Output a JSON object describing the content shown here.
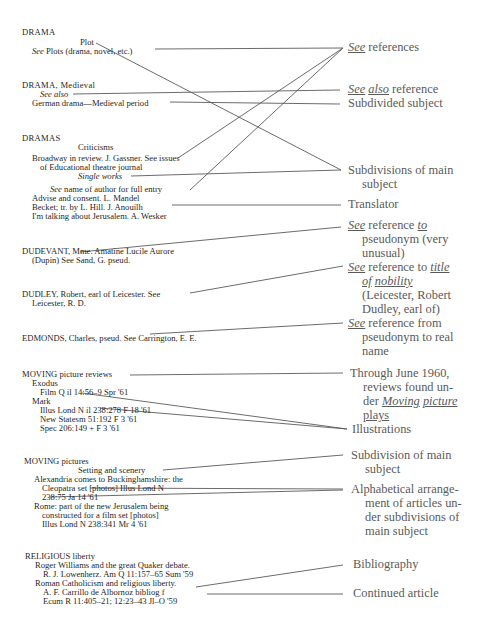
{
  "entries": {
    "drama": {
      "heading": "DRAMA",
      "subhead": "Plot",
      "see_word": "See",
      "see_text": " Plots (drama, novel, etc.)"
    },
    "drama_medieval": {
      "heading": "DRAMA, Medieval",
      "see_also": "See also",
      "ref": "German drama—Medieval period"
    },
    "dramas": {
      "heading": "DRAMAS",
      "subhead": "Criticisms",
      "line1": "Broadway in review. J. Gassner. See issues",
      "line2": "of Educational theatre journal",
      "subhead2": "Single works",
      "see_word": "See",
      "see_text": " name of author for full entry",
      "item1": "Advise and consent. L. Mandel",
      "item2": "Becket; tr. by L. Hill. J. Anouilh",
      "item3": "I'm talking about Jerusalem. A. Wesker"
    },
    "dudevant": {
      "line1": "DUDEVANT, Mme. Amatine Lucile Aurore",
      "line2": "(Dupin) See Sand, G. pseud."
    },
    "dudley": {
      "line1": "DUDLEY, Robert, earl of Leicester. See",
      "line2": "Leicester, R. D."
    },
    "edmonds": {
      "line1": "EDMONDS, Charles, pseud. See Carrington, E. E."
    },
    "moving_reviews": {
      "heading": "MOVING picture reviews",
      "title1": "Exodus",
      "cite1": "Film Q il 14:56–9 Spr '61",
      "title2": "Mark",
      "cite2": "Illus Lond N il 238:278 F 18 '61",
      "cite3": "New Statesm 51:192 F 3 '61",
      "cite4": "Spec 206:149 + F 3 '61"
    },
    "moving_pictures": {
      "heading": "MOVING pictures",
      "subhead": "Setting and scenery",
      "a1": "Alexandria comes to Buckinghamshire: the",
      "a2": "Cleopatra set [photos] Illus Lond N",
      "a3": "238:75 Ja 14 '61",
      "b1": "Rome: part of the new Jerusalem being",
      "b2": "constructed for a film set [photos]",
      "b3": "Illus Lond N 238:341 Mr 4 '61"
    },
    "religious": {
      "heading": "RELIGIOUS liberty",
      "a1": "Roger Williams and the great Quaker debate.",
      "a2": "R. J. Lowenherz. Am Q 11:157–65 Sum '59",
      "b1": "Roman Catholicism and religious liberty.",
      "b2": "A. F. Carrillo de Albornoz bibliog f",
      "b3": "Ecum R 11:405–21; 12:23–43 Jl–O '59"
    }
  },
  "labels": {
    "see_references": {
      "see": "See",
      "rest": " references"
    },
    "see_also_reference": {
      "see": "See",
      "also": "also",
      "rest": " reference"
    },
    "subdivided_subject": "Subdivided subject",
    "subdivisions_main": {
      "line1": "Subdivisions of main",
      "line2": "subject"
    },
    "translator": "Translator",
    "see_to_pseudonym": {
      "see": "See",
      "mid": " reference ",
      "to": "to",
      "line2": "pseudonym (very",
      "line3": "unusual)"
    },
    "see_title_nobility": {
      "see": "See",
      "mid": " reference to ",
      "title": "title",
      "line2a": "of",
      "line2b": "nobility",
      "line3": "(Leicester, Robert",
      "line4": "Dudley, earl of)"
    },
    "see_from_pseudonym": {
      "see": "See",
      "rest": " reference from",
      "line2": "pseudonym to real",
      "line3": "name"
    },
    "through_june": {
      "line1": "Through June 1960,",
      "line2": "reviews found un-",
      "line3a": "der ",
      "line3b": "Moving",
      "line3c": "picture",
      "line4": "plays"
    },
    "illustrations": "Illustrations",
    "subdivision_main": {
      "line1": "Subdivision of main",
      "line2": "subject"
    },
    "alphabetical": {
      "line1": "Alphabetical arrange-",
      "line2": "ment of articles un-",
      "line3": "der subdivisions of",
      "line4": "main subject"
    },
    "bibliography": "Bibliography",
    "continued_article": "Continued article"
  }
}
